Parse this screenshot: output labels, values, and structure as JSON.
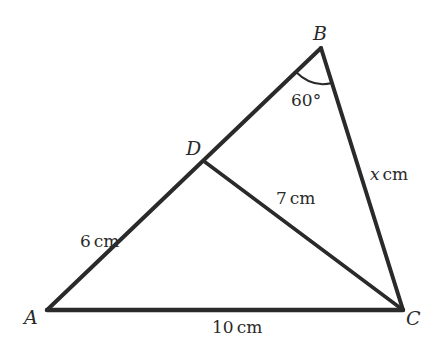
{
  "diagram": {
    "vertices": {
      "A": {
        "label": "A",
        "x": 47,
        "y": 310
      },
      "B": {
        "label": "B",
        "x": 321,
        "y": 48
      },
      "C": {
        "label": "C",
        "x": 403,
        "y": 310
      },
      "D": {
        "label": "D",
        "x": 205,
        "y": 162
      }
    },
    "lengths": {
      "AD": "6 cm",
      "DC": "7 cm",
      "AC": "10 cm",
      "BC": "x cm"
    },
    "angle_B": "60°",
    "stroke_color": "#2a2a2a"
  },
  "labels": {
    "A": "A",
    "B": "B",
    "C": "C",
    "D": "D",
    "AD_num": "6",
    "DC_num": "7",
    "AC_num": "10",
    "BC_var": "x",
    "unit": "cm",
    "angle": "60°"
  }
}
